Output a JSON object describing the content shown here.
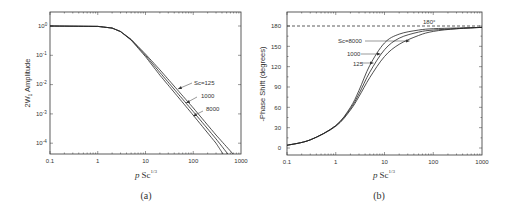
{
  "chart_data": [
    {
      "panel": "a",
      "type": "line",
      "caption": "(a)",
      "title": "",
      "xlabel": "p Sc^1/3",
      "ylabel": "2W1 Amplitude",
      "xscale": "log",
      "yscale": "log",
      "xlim": [
        0.1,
        1000
      ],
      "ylim": [
        4.3e-05,
        2
      ],
      "xticks": [
        "0.1",
        "1",
        "10",
        "100",
        "1000"
      ],
      "yticks": [
        "10^0",
        "10^-1",
        "10^-2",
        "10^-3",
        "10^-4"
      ],
      "grid": false,
      "series": [
        {
          "name": "Sc=125",
          "x": [
            0.1,
            1,
            2,
            3,
            5,
            10,
            20,
            50,
            100,
            300,
            680
          ],
          "y": [
            1.0,
            0.97,
            0.85,
            0.65,
            0.35,
            0.11,
            0.032,
            0.0058,
            0.0016,
            0.00019,
            4.3e-05
          ]
        },
        {
          "name": "1000",
          "x": [
            0.1,
            1,
            2,
            3,
            5,
            10,
            20,
            50,
            100,
            300,
            530
          ],
          "y": [
            1.0,
            0.97,
            0.85,
            0.65,
            0.34,
            0.1,
            0.026,
            0.0045,
            0.0012,
            0.00014,
            4.3e-05
          ]
        },
        {
          "name": "8000",
          "x": [
            0.1,
            1,
            2,
            3,
            5,
            10,
            20,
            50,
            100,
            300,
            420
          ],
          "y": [
            1.0,
            0.97,
            0.85,
            0.64,
            0.33,
            0.09,
            0.021,
            0.0035,
            0.0009,
            0.0001,
            4.3e-05
          ]
        }
      ],
      "annotations": [
        "Sc=125",
        "1000",
        "8000"
      ]
    },
    {
      "panel": "b",
      "type": "line",
      "caption": "(b)",
      "title": "",
      "xlabel": "p Sc^1/3",
      "ylabel": "-Phase Shift (degrees)",
      "xscale": "log",
      "yscale": "linear",
      "xlim": [
        0.1,
        1000
      ],
      "ylim": [
        -10,
        200
      ],
      "xticks": [
        "0.1",
        "1",
        "10",
        "100",
        "1000"
      ],
      "yticks": [
        "0",
        "30",
        "60",
        "90",
        "120",
        "150",
        "180"
      ],
      "grid": false,
      "reference_line": {
        "y": 180,
        "style": "dashed",
        "label": "180°"
      },
      "series": [
        {
          "name": "Sc=8000",
          "x": [
            0.1,
            0.3,
            1,
            2,
            3,
            5,
            10,
            20,
            50,
            100,
            300,
            1000
          ],
          "y": [
            4,
            12,
            33,
            60,
            85,
            122,
            155,
            168,
            174,
            176,
            177,
            178
          ]
        },
        {
          "name": "1000",
          "x": [
            0.1,
            0.3,
            1,
            2,
            3,
            5,
            10,
            20,
            50,
            100,
            300,
            1000
          ],
          "y": [
            4,
            12,
            33,
            58,
            80,
            112,
            145,
            162,
            171,
            174,
            176,
            178
          ]
        },
        {
          "name": "125",
          "x": [
            0.1,
            0.3,
            1,
            2,
            3,
            5,
            10,
            20,
            50,
            100,
            300,
            1000
          ],
          "y": [
            4,
            12,
            32,
            56,
            76,
            104,
            135,
            153,
            166,
            172,
            176,
            178
          ]
        }
      ],
      "annotations": [
        "Sc=8000",
        "1000",
        "125",
        "180°"
      ]
    }
  ],
  "panel_a": {
    "caption": "(a)",
    "ylabel": "2W",
    "ylabel_sub": "1",
    "ylabel_rest": " Amplitude",
    "xlabel_p": "p",
    "xlabel_sc": "Sc",
    "xlabel_sup": "1/3",
    "xticks": [
      "0.1",
      "1",
      "10",
      "100",
      "1000"
    ],
    "ytick_base": "10",
    "ytick_exps": [
      "0",
      "-1",
      "-2",
      "-3",
      "-4"
    ],
    "annot": [
      "Sc=125",
      "1000",
      "8000"
    ]
  },
  "panel_b": {
    "caption": "(b)",
    "ylabel": "-Phase Shift (degrees)",
    "xlabel_p": "p",
    "xlabel_sc": "Sc",
    "xlabel_sup": "1/3",
    "xticks": [
      "0.1",
      "1",
      "10",
      "100",
      "1000"
    ],
    "yticks": [
      "0",
      "30",
      "60",
      "90",
      "120",
      "150",
      "180"
    ],
    "ref_label": "180°",
    "annot": [
      "Sc=8000",
      "1000",
      "125"
    ]
  }
}
